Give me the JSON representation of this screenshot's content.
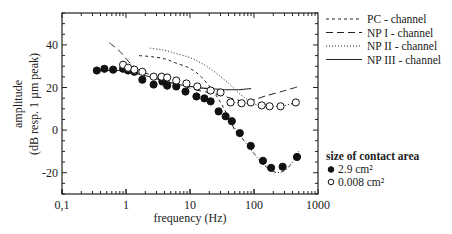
{
  "chart_data": {
    "type": "scatter",
    "title": "",
    "xlabel": "frequency (Hz)",
    "ylabel_line1": "amplitude",
    "ylabel_line2": "(dB resp. 1 µm peak)",
    "xscale": "log",
    "xlim": [
      0.1,
      1000
    ],
    "ylim": [
      -30,
      55
    ],
    "grid": false,
    "x_ticks": [
      {
        "value": 0.1,
        "label": "0,1"
      },
      {
        "value": 1,
        "label": "1"
      },
      {
        "value": 10,
        "label": "10"
      },
      {
        "value": 100,
        "label": "100"
      },
      {
        "value": 1000,
        "label": "1000"
      }
    ],
    "y_ticks": [
      {
        "value": -20,
        "label": "-20"
      },
      {
        "value": 0,
        "label": "0"
      },
      {
        "value": 20,
        "label": "20"
      },
      {
        "value": 40,
        "label": "40"
      }
    ],
    "y_minor_step": 5,
    "channel_legend": {
      "placement": "top-right outside",
      "entries": [
        {
          "key": "pc",
          "label": "PC - channel",
          "style": "short-dash"
        },
        {
          "key": "np1",
          "label": "NP I - channel",
          "style": "long-dash"
        },
        {
          "key": "np2",
          "label": "NP II - channel",
          "style": "dotted"
        },
        {
          "key": "np3",
          "label": "NP III - channel",
          "style": "solid"
        }
      ]
    },
    "marker_legend": {
      "placement": "bottom-right outside",
      "title": "size of contact area",
      "entries": [
        {
          "key": "large",
          "label": "2.9 cm²",
          "marker": "filled-circle"
        },
        {
          "key": "small",
          "label": "0.008 cm²",
          "marker": "open-circle"
        }
      ]
    },
    "series": [
      {
        "name": "2.9 cm²",
        "marker": "filled-circle",
        "x": [
          0.35,
          0.46,
          0.63,
          0.9,
          1.08,
          1.35,
          1.8,
          2.7,
          3.7,
          4.4,
          6.1,
          8.5,
          12.6,
          16.8,
          21,
          28,
          36,
          45,
          60,
          89,
          138,
          185,
          280,
          470
        ],
        "y": [
          28,
          28.8,
          28.4,
          28.8,
          28,
          27.4,
          23.7,
          21.4,
          22.8,
          20.9,
          20.5,
          18.1,
          15.8,
          14.9,
          13.5,
          8.8,
          6.5,
          4.2,
          -1.4,
          -7.4,
          -14.4,
          -17.7,
          -17.2,
          -12.6
        ]
      },
      {
        "name": "0.008 cm²",
        "marker": "open-circle",
        "x": [
          0.9,
          1.08,
          1.35,
          1.8,
          2.7,
          3.6,
          4.4,
          6.1,
          8.8,
          13,
          21,
          30,
          43,
          64,
          89,
          132,
          175,
          260,
          450
        ],
        "y": [
          30.7,
          29.3,
          28.4,
          27.4,
          25.1,
          25.1,
          24.7,
          23.3,
          21.9,
          20.5,
          18.6,
          17.7,
          13,
          12.6,
          13,
          11.6,
          11.2,
          11.2,
          13
        ]
      }
    ],
    "curves": [
      {
        "name": "PC - channel",
        "style": "short-dash",
        "x": [
          1.6,
          2.5,
          4,
          6,
          10,
          15,
          22,
          30,
          40,
          50,
          60
        ],
        "y": [
          35,
          34.5,
          33.5,
          31.5,
          29,
          25,
          19,
          13,
          6,
          0,
          -3
        ]
      },
      {
        "name": "NP I - channel",
        "style": "long-dash",
        "x": [
          0.55,
          0.8,
          1.2,
          1.8,
          3,
          6,
          12,
          25,
          50,
          80,
          150,
          300,
          500
        ],
        "y": [
          41,
          37,
          31,
          27.5,
          25,
          22,
          19,
          17,
          14.5,
          13.5,
          16,
          18.5,
          20.5
        ]
      },
      {
        "name": "NP II - channel",
        "style": "dotted",
        "x": [
          2.4,
          4,
          6,
          10,
          16,
          25,
          40,
          60,
          90
        ],
        "y": [
          38.5,
          37.5,
          36,
          34,
          31,
          27,
          22,
          17,
          13
        ]
      },
      {
        "name": "NP III - channel",
        "style": "solid",
        "x": [
          0.35,
          0.6,
          1,
          1.5,
          2.5,
          4,
          7,
          12,
          20,
          35,
          60,
          90
        ],
        "y": [
          28,
          28,
          27.8,
          26.5,
          24.8,
          23,
          21.3,
          20.2,
          19.5,
          19,
          19,
          19.5
        ]
      },
      {
        "name": "fit 2.9 cm²",
        "style": "dash-dot",
        "x": [
          35,
          50,
          70,
          100,
          140,
          200,
          280,
          380,
          500
        ],
        "y": [
          6,
          1,
          -5,
          -11,
          -16,
          -19.5,
          -19.5,
          -16,
          -10
        ]
      },
      {
        "name": "fit 0.008 cm²",
        "style": "dotted-fine",
        "x": [
          40,
          80,
          140,
          200,
          300,
          450
        ],
        "y": [
          13,
          12.6,
          11.4,
          11,
          11.5,
          13
        ]
      }
    ]
  }
}
